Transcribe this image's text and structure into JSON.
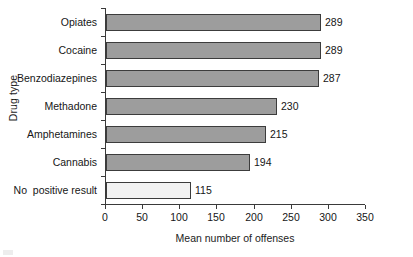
{
  "chart_data": {
    "type": "bar",
    "orientation": "horizontal",
    "title": "",
    "xlabel": "Mean number of offenses",
    "ylabel": "Drug type",
    "categories": [
      "Opiates",
      "Cocaine",
      "Benzodiazepines",
      "Methadone",
      "Amphetamines",
      "Cannabis",
      "No  positive result"
    ],
    "values": [
      289,
      289,
      287,
      230,
      215,
      194,
      115
    ],
    "bar_styles": [
      "filled",
      "filled",
      "filled",
      "filled",
      "filled",
      "filled",
      "empty"
    ],
    "xlim": [
      0,
      350
    ],
    "xticks": [
      0,
      50,
      100,
      150,
      200,
      250,
      300,
      350
    ],
    "xticklabels": [
      "0",
      "50",
      "100",
      "150",
      "200",
      "250",
      "300",
      "350"
    ],
    "grid": false,
    "legend": false,
    "value_labels": [
      "289",
      "289",
      "287",
      "230",
      "215",
      "194",
      "115"
    ],
    "colors": {
      "bar_fill": "#9d9d9d",
      "bar_empty_fill": "#f2f2f2",
      "bar_edge": "#3c3c3c",
      "axis": "#3a3a3a",
      "text": "#161616",
      "background": "#ffffff"
    }
  }
}
